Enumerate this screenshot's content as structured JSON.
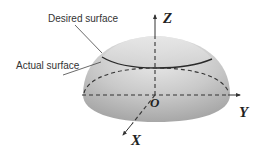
{
  "labels": {
    "desired_surface": "Desired surface",
    "actual_surface": "Actual surface"
  },
  "axes": {
    "z": "Z",
    "y": "Y",
    "x": "X",
    "origin": "O"
  },
  "colors": {
    "dome_light": "#e6e6e6",
    "dome_dark": "#a8a8a8",
    "line": "#333333",
    "desired_rim": "#2a2a2a"
  }
}
